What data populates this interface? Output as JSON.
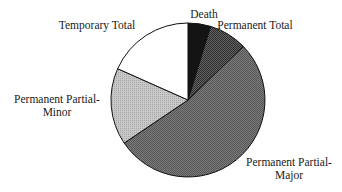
{
  "chart_data": {
    "type": "pie",
    "title": "",
    "start_angle_deg": 0,
    "direction": "clockwise",
    "center": [
      188,
      100
    ],
    "radius": 77,
    "slices": [
      {
        "label": "Death",
        "value": 4.7,
        "angle_start": 0,
        "angle_end": 17,
        "fill": "#141414",
        "pattern": "solid-black"
      },
      {
        "label": "Permanent Total",
        "value": 8.1,
        "angle_start": 17,
        "angle_end": 46,
        "fill": "#4a4a4a",
        "pattern": "fine-dither"
      },
      {
        "label": "Permanent Partial-Major",
        "value": 52.8,
        "angle_start": 46,
        "angle_end": 236,
        "fill": "#6b6b6b",
        "pattern": "medium-dither"
      },
      {
        "label": "Permanent Partial-Minor",
        "value": 16.1,
        "angle_start": 236,
        "angle_end": 294,
        "fill": "#bcbcbc",
        "pattern": "light-dither"
      },
      {
        "label": "Temporary Total",
        "value": 18.3,
        "angle_start": 294,
        "angle_end": 360,
        "fill": "#ffffff",
        "pattern": "white"
      }
    ],
    "labels": [
      {
        "lines": [
          "Death"
        ],
        "x": 204,
        "y": 18,
        "anchor": "middle"
      },
      {
        "lines": [
          "Permanent Total"
        ],
        "x": 255,
        "y": 29,
        "anchor": "middle"
      },
      {
        "lines": [
          "Temporary Total"
        ],
        "x": 97,
        "y": 29,
        "anchor": "middle"
      },
      {
        "lines": [
          "Permanent Partial-",
          "Minor"
        ],
        "x": 57,
        "y": 103,
        "anchor": "middle"
      },
      {
        "lines": [
          "Permanent Partial-",
          "Major"
        ],
        "x": 289,
        "y": 166,
        "anchor": "middle"
      }
    ],
    "legend": "none",
    "units": "percent (estimated from slice angles)"
  }
}
